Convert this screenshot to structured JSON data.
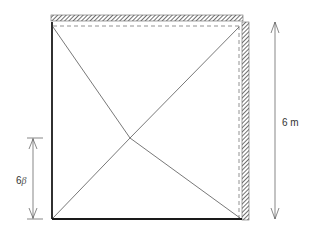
{
  "diagram": {
    "type": "plate-yield-line",
    "labels": {
      "side_dimension": "6 m",
      "point_height": "6",
      "point_height_symbol": "β"
    },
    "edges": {
      "top": "fixed",
      "right": "fixed",
      "left": "simply-supported",
      "bottom": "simply-supported"
    },
    "colors": {
      "edge_line": "#1a1a1a",
      "yield_line": "#555555",
      "dashed_line": "#666666",
      "hatch": "#333333",
      "dimension_line": "#555555"
    }
  }
}
